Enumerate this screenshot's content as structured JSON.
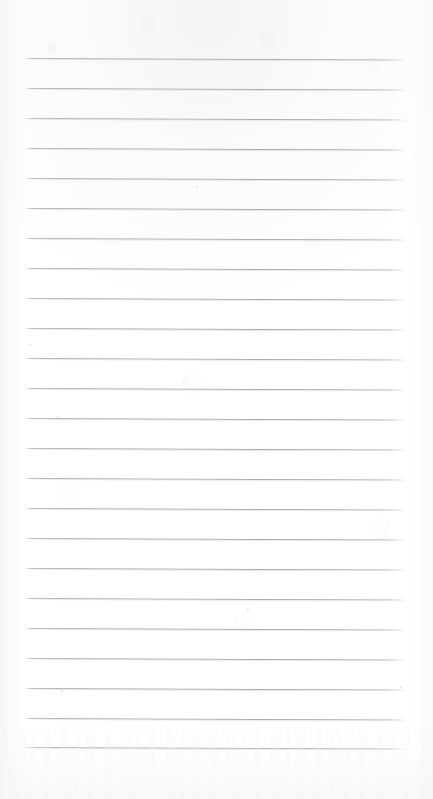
{
  "document": {
    "kind": "scanned-lined-paper",
    "title": "Blank ruled notebook page",
    "page_width": 433,
    "page_height": 799,
    "orientation": "portrait",
    "visible_text": "",
    "colors": {
      "background": "#fefefe",
      "paper_top_tint": "#f5f6f8",
      "rule_line": "#aeafb5",
      "rule_line_ghost": "#dddee3",
      "speck": "#cdced3"
    },
    "ruling": {
      "style": "wide-ruled horizontal lines",
      "line_count": 24,
      "line_spacing_px": 30,
      "first_line_y": 58,
      "last_line_y": 747,
      "line_left_x": 24,
      "line_right_x": 405,
      "line_thickness_px": 1,
      "skew_degrees": 0.22,
      "margin_rule": "none",
      "header_blank_px": 58,
      "footer_blank_px": 52
    },
    "lines": [
      {
        "index": 1,
        "y": 58,
        "left": 24,
        "right": 405
      },
      {
        "index": 2,
        "y": 88,
        "left": 24,
        "right": 405
      },
      {
        "index": 3,
        "y": 118,
        "left": 24,
        "right": 405
      },
      {
        "index": 4,
        "y": 148,
        "left": 24,
        "right": 405
      },
      {
        "index": 5,
        "y": 178,
        "left": 24,
        "right": 405
      },
      {
        "index": 6,
        "y": 208,
        "left": 24,
        "right": 405
      },
      {
        "index": 7,
        "y": 238,
        "left": 24,
        "right": 405
      },
      {
        "index": 8,
        "y": 268,
        "left": 24,
        "right": 405
      },
      {
        "index": 9,
        "y": 298,
        "left": 24,
        "right": 405
      },
      {
        "index": 10,
        "y": 328,
        "left": 24,
        "right": 405
      },
      {
        "index": 11,
        "y": 358,
        "left": 24,
        "right": 405
      },
      {
        "index": 12,
        "y": 388,
        "left": 24,
        "right": 405
      },
      {
        "index": 13,
        "y": 418,
        "left": 24,
        "right": 405
      },
      {
        "index": 14,
        "y": 448,
        "left": 24,
        "right": 405
      },
      {
        "index": 15,
        "y": 478,
        "left": 24,
        "right": 405
      },
      {
        "index": 16,
        "y": 508,
        "left": 24,
        "right": 405
      },
      {
        "index": 17,
        "y": 538,
        "left": 24,
        "right": 405
      },
      {
        "index": 18,
        "y": 568,
        "left": 24,
        "right": 405
      },
      {
        "index": 19,
        "y": 598,
        "left": 24,
        "right": 405
      },
      {
        "index": 20,
        "y": 628,
        "left": 24,
        "right": 405
      },
      {
        "index": 21,
        "y": 658,
        "left": 24,
        "right": 405
      },
      {
        "index": 22,
        "y": 688,
        "left": 24,
        "right": 405
      },
      {
        "index": 23,
        "y": 718,
        "left": 24,
        "right": 405
      },
      {
        "index": 24,
        "y": 747,
        "left": 24,
        "right": 405
      }
    ],
    "specks": [
      {
        "x": 29,
        "y": 344,
        "size": 2
      },
      {
        "x": 196,
        "y": 186,
        "size": 2
      },
      {
        "x": 183,
        "y": 382,
        "size": 2
      },
      {
        "x": 57,
        "y": 416,
        "size": 2
      },
      {
        "x": 400,
        "y": 686,
        "size": 2
      },
      {
        "x": 61,
        "y": 690,
        "size": 2
      },
      {
        "x": 247,
        "y": 608,
        "size": 2
      }
    ]
  }
}
